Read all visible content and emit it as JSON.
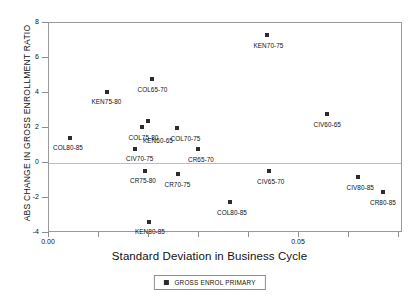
{
  "chart_data": {
    "type": "scatter",
    "title": "",
    "xlabel": "Standard Deviation in Business Cycle",
    "ylabel": "ABS CHANGE IN GROSS ENROLLMENT RATIO",
    "xlim": [
      0.0,
      0.0708
    ],
    "ylim": [
      -4,
      8
    ],
    "xticks": [
      0.0,
      0.01,
      0.02,
      0.03,
      0.04,
      0.05,
      0.06,
      0.07
    ],
    "xticklabels": [
      "0.00",
      "",
      "",
      "",
      "",
      "0.05",
      "",
      ""
    ],
    "yticks": [
      -4,
      -2,
      0,
      2,
      4,
      6,
      8
    ],
    "yticklabels": [
      "-4",
      "-2",
      "0",
      "2",
      "4",
      "6",
      "8"
    ],
    "grid": false,
    "zeroline": true,
    "legend_position": "below-center",
    "series": [
      {
        "name": "GROSS ENROL PRIMARY",
        "marker": "square",
        "color": "#2c2c2c",
        "points": [
          {
            "label": "COL80-85",
            "x": 0.0042,
            "y": 1.45,
            "lx": -17,
            "ly": 6
          },
          {
            "label": "KEN75-80",
            "x": 0.0115,
            "y": 4.05,
            "lx": -15,
            "ly": 6
          },
          {
            "label": "COL65-70",
            "x": 0.0205,
            "y": 4.78,
            "lx": -14,
            "ly": 7
          },
          {
            "label": "COL75-80",
            "x": 0.0185,
            "y": 2.05,
            "lx": -13,
            "ly": 7
          },
          {
            "label": "KEN60-65",
            "x": 0.0198,
            "y": 2.42,
            "lx": -5,
            "ly": 16
          },
          {
            "label": "CIV70-75",
            "x": 0.0172,
            "y": 0.82,
            "lx": -9,
            "ly": 6
          },
          {
            "label": "COL70-75",
            "x": 0.0255,
            "y": 2.02,
            "lx": -6,
            "ly": 7
          },
          {
            "label": "CR65-70",
            "x": 0.0298,
            "y": 0.82,
            "lx": -10,
            "ly": 7
          },
          {
            "label": "CR75-80",
            "x": 0.0192,
            "y": -0.45,
            "lx": -15,
            "ly": 6
          },
          {
            "label": "CR70-75",
            "x": 0.0257,
            "y": -0.6,
            "lx": -13,
            "ly": 7
          },
          {
            "label": "KEN80-85",
            "x": 0.02,
            "y": -3.38,
            "lx": -14,
            "ly": 6
          },
          {
            "label": "COL80-85b",
            "x": 0.0362,
            "y": -2.22,
            "lx": -13,
            "ly": 7
          },
          {
            "label": "KEN70-75",
            "x": 0.0435,
            "y": 7.32,
            "lx": -13,
            "ly": 7
          },
          {
            "label": "CIV65-70",
            "x": 0.044,
            "y": -0.45,
            "lx": -12,
            "ly": 7
          },
          {
            "label": "CIV60-65",
            "x": 0.0555,
            "y": 2.78,
            "lx": -13,
            "ly": 7
          },
          {
            "label": "CIV80-85",
            "x": 0.0617,
            "y": -0.82,
            "lx": -11,
            "ly": 7
          },
          {
            "label": "CR80-85",
            "x": 0.0668,
            "y": -1.68,
            "lx": -13,
            "ly": 7
          }
        ]
      }
    ]
  },
  "legend": {
    "entries": [
      {
        "label": "GROSS ENROL PRIMARY",
        "color": "#2c2c2c"
      }
    ]
  },
  "point_labels": {
    "COL80-85": "COL80-85",
    "KEN75-80": "KEN75-80",
    "COL65-70": "COL65-70",
    "COL75-80": "COL75-80",
    "KEN60-65": "KEN60-65",
    "CIV70-75": "CIV70-75",
    "COL70-75": "COL70-75",
    "CR65-70": "CR65-70",
    "CR75-80": "CR75-80",
    "CR70-75": "CR70-75",
    "KEN80-85": "KEN80-85",
    "COL80-85b": "COL80-85",
    "KEN70-75": "KEN70-75",
    "CIV65-70": "CIV65-70",
    "CIV60-65": "CIV60-65",
    "CIV80-85": "CIV80-85",
    "CR80-85": "CR80-85"
  }
}
